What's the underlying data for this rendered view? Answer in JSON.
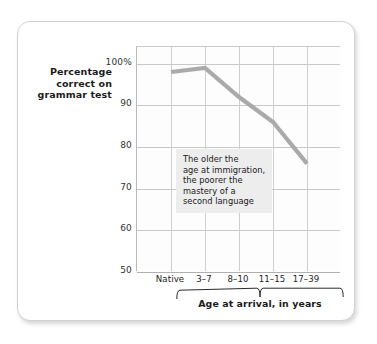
{
  "figure": {
    "y_axis_title_lines": [
      "Percentage",
      "correct on",
      "grammar test"
    ],
    "x_axis_caption": "Age at arrival, in years",
    "annotation_lines": [
      "The older the",
      "age at immigration,",
      "the poorer the",
      "mastery of a",
      "second language"
    ],
    "colors": {
      "line": "#aaaaaa",
      "grid": "#cfcfcf",
      "axis": "#b0b0b0",
      "annotation_background": "#ededed",
      "card_border": "#d2d2d2",
      "text": "#1b1b1b"
    }
  },
  "chart_data": {
    "type": "line",
    "title": "",
    "xlabel": "Age at arrival, in years",
    "ylabel": "Percentage correct on grammar test",
    "categories": [
      "Native",
      "3–7",
      "8–10",
      "11–15",
      "17–39"
    ],
    "values": [
      98,
      99,
      92,
      86,
      76
    ],
    "series": [
      {
        "name": "Percentage correct on grammar test",
        "values": [
          98,
          99,
          92,
          86,
          76
        ]
      }
    ],
    "ylim": [
      50,
      104
    ],
    "yticks": [
      100,
      90,
      80,
      70,
      60,
      50
    ],
    "ytick_labels": [
      "100%",
      "90",
      "80",
      "70",
      "60",
      "50"
    ],
    "grid": true,
    "legend": false,
    "annotations": [
      {
        "text": "The older the age at immigration, the poorer the mastery of a second language",
        "x_category": "8–10",
        "y": 79
      }
    ],
    "axis_group_brace": {
      "label": "Age at arrival, in years",
      "covers": [
        "3–7",
        "8–10",
        "11–15",
        "17–39"
      ]
    }
  }
}
